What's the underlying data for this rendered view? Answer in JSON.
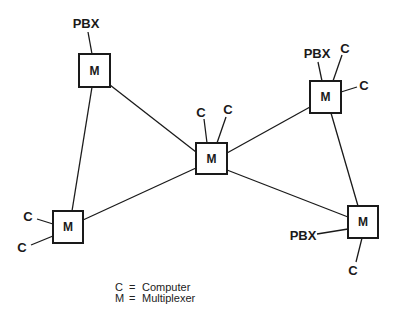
{
  "diagram": {
    "nodes": [
      {
        "id": "m_top_left",
        "label": "M",
        "x": 79,
        "y": 54,
        "w": 31,
        "h": 33
      },
      {
        "id": "m_center",
        "label": "M",
        "x": 196,
        "y": 143,
        "w": 31,
        "h": 31
      },
      {
        "id": "m_top_right",
        "label": "M",
        "x": 310,
        "y": 81,
        "w": 31,
        "h": 32
      },
      {
        "id": "m_left",
        "label": "M",
        "x": 53,
        "y": 211,
        "w": 30,
        "h": 32
      },
      {
        "id": "m_right",
        "label": "M",
        "x": 348,
        "y": 206,
        "w": 30,
        "h": 32
      }
    ],
    "attachments": [
      {
        "label": "PBX",
        "node": "m_top_left"
      },
      {
        "label": "C",
        "node": "m_center"
      },
      {
        "label": "C",
        "node": "m_center"
      },
      {
        "label": "PBX",
        "node": "m_top_right"
      },
      {
        "label": "C",
        "node": "m_top_right"
      },
      {
        "label": "C",
        "node": "m_top_right"
      },
      {
        "label": "C",
        "node": "m_left"
      },
      {
        "label": "C",
        "node": "m_left"
      },
      {
        "label": "PBX",
        "node": "m_right"
      },
      {
        "label": "C",
        "node": "m_right"
      }
    ],
    "edges": [
      [
        "m_top_left",
        "m_center"
      ],
      [
        "m_top_left",
        "m_left"
      ],
      [
        "m_left",
        "m_center"
      ],
      [
        "m_center",
        "m_top_right"
      ],
      [
        "m_center",
        "m_right"
      ],
      [
        "m_top_right",
        "m_right"
      ]
    ]
  },
  "labels": {
    "m": "M",
    "c": "C",
    "pbx": "PBX"
  },
  "legend": {
    "items": [
      {
        "symbol": "C",
        "eq": "=",
        "meaning": "Computer"
      },
      {
        "symbol": "M",
        "eq": "=",
        "meaning": "Multiplexer"
      }
    ]
  }
}
